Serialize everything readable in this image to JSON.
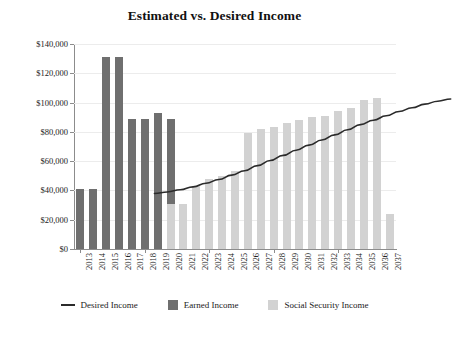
{
  "chart_data": {
    "type": "bar",
    "title": "Estimated vs. Desired Income",
    "xlabel": "",
    "ylabel": "",
    "ylim": [
      0,
      140000
    ],
    "grid": true,
    "legend_position": "bottom",
    "y_ticks": [
      "$0",
      "$20,000",
      "$40,000",
      "$60,000",
      "$80,000",
      "$100,000",
      "$120,000",
      "$140,000"
    ],
    "y_tick_values": [
      0,
      20000,
      40000,
      60000,
      80000,
      100000,
      120000,
      140000
    ],
    "categories": [
      "2013",
      "2014",
      "2015",
      "2016",
      "2017",
      "2018",
      "2019",
      "2020",
      "2021",
      "2022",
      "2023",
      "2024",
      "2025",
      "2026",
      "2027",
      "2028",
      "2029",
      "2030",
      "2031",
      "2032",
      "2033",
      "2034",
      "2035",
      "2036",
      "2037"
    ],
    "stacked": true,
    "series": [
      {
        "name": "Earned Income",
        "color": "#6f6f6f",
        "type": "bar",
        "values": [
          41000,
          41000,
          131000,
          131000,
          89000,
          89000,
          93000,
          89000,
          0,
          0,
          0,
          0,
          0,
          0,
          0,
          0,
          0,
          0,
          0,
          0,
          0,
          0,
          0,
          0,
          0
        ]
      },
      {
        "name": "Social Security Income",
        "color": "#d2d2d2",
        "type": "bar",
        "values": [
          0,
          0,
          0,
          0,
          0,
          0,
          0,
          31000,
          31000,
          43000,
          48000,
          50000,
          53000,
          79000,
          82000,
          83000,
          86000,
          88000,
          90000,
          91000,
          94000,
          96000,
          102000,
          103000,
          24000
        ]
      },
      {
        "name": "Desired Income",
        "color": "#2b2b2b",
        "type": "line",
        "values": [
          68000,
          69000,
          70500,
          72500,
          75000,
          77500,
          80500,
          83500,
          87000,
          90500,
          94000,
          97500,
          101000,
          104500,
          108000,
          111500,
          115000,
          118000,
          121000,
          124000,
          126500,
          129000,
          131000,
          132500,
          null
        ]
      }
    ],
    "legend": [
      {
        "label": "Desired Income",
        "marker": "line",
        "color": "#2b2b2b"
      },
      {
        "label": "Earned Income",
        "marker": "square",
        "color": "#6f6f6f"
      },
      {
        "label": "Social Security Income",
        "marker": "square",
        "color": "#d2d2d2"
      }
    ]
  }
}
